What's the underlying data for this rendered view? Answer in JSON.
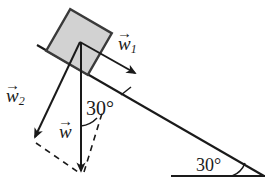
{
  "figure": {
    "background_color": "#ffffff",
    "stroke_color": "#1a1a1a",
    "block_fill_color": "#d2d2d2",
    "block_stroke_color": "#3a3a3a"
  },
  "labels": {
    "w1": {
      "symbol": "w",
      "subscript": "1",
      "accent": "vector-arrow"
    },
    "w2": {
      "symbol": "w",
      "subscript": "2",
      "accent": "vector-arrow"
    },
    "w": {
      "symbol": "w",
      "subscript": "",
      "accent": "vector-arrow"
    },
    "angle_incline": "30°",
    "angle_base": "30°"
  },
  "vectors": [
    {
      "name": "w1",
      "label": "w⃗₁",
      "direction": "down-slope",
      "style": "solid"
    },
    {
      "name": "w2",
      "label": "w⃗₂",
      "direction": "perpendicular-into-incline",
      "style": "solid"
    },
    {
      "name": "w",
      "label": "w⃗",
      "direction": "vertical-down",
      "style": "solid"
    }
  ],
  "geometry": {
    "incline_angle_deg": 30,
    "weight_angle_from_perpendicular_deg": 30
  }
}
